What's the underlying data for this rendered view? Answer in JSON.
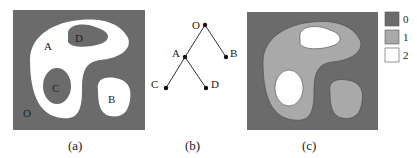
{
  "colors": {
    "dark": "#6b6b6b",
    "mid": "#a9a9a9",
    "light": "#ffffff",
    "line": "#333333"
  },
  "panel_a": {
    "caption": "(a)",
    "labels": {
      "O": "O",
      "A": "A",
      "B": "B",
      "C": "C",
      "D": "D"
    }
  },
  "panel_b": {
    "caption": "(b)",
    "nodes": {
      "O": "O",
      "A": "A",
      "B": "B",
      "C": "C",
      "D": "D"
    },
    "edges": [
      [
        "O",
        "A"
      ],
      [
        "O",
        "B"
      ],
      [
        "A",
        "C"
      ],
      [
        "A",
        "D"
      ]
    ]
  },
  "panel_c": {
    "caption": "(c)",
    "legend": [
      {
        "label": "0",
        "color": "#6b6b6b"
      },
      {
        "label": "1",
        "color": "#a9a9a9"
      },
      {
        "label": "2",
        "color": "#ffffff"
      }
    ]
  }
}
